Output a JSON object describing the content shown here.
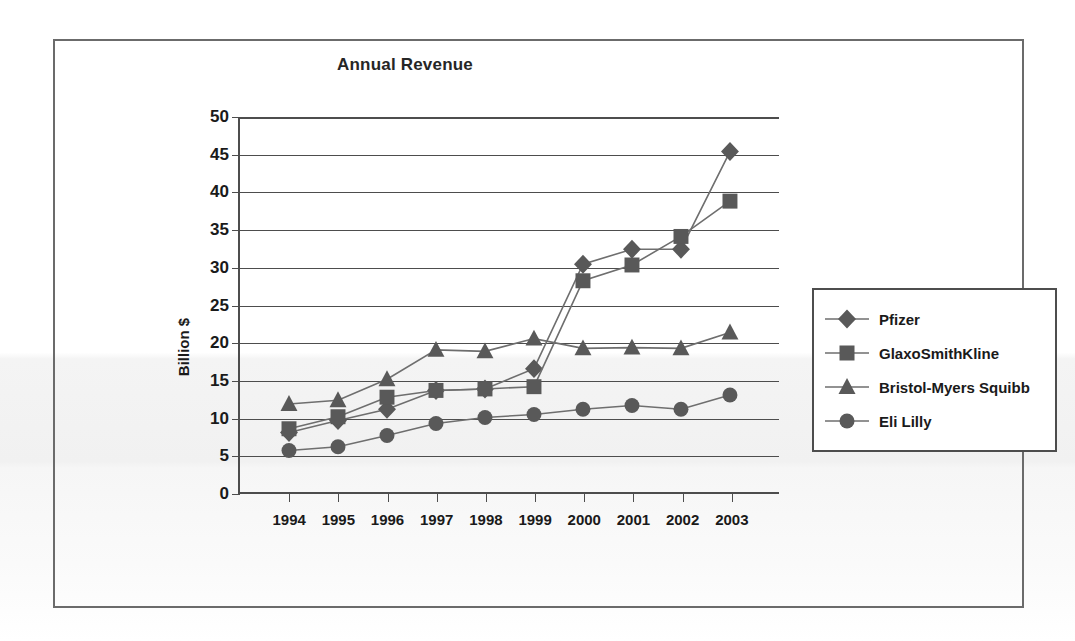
{
  "chart_data": {
    "type": "line",
    "title": "Annual Revenue",
    "xlabel": "",
    "ylabel": "Billion $",
    "ylim": [
      0,
      50
    ],
    "ytick_step": 5,
    "yticks": [
      0,
      5,
      10,
      15,
      20,
      25,
      30,
      35,
      40,
      45,
      50
    ],
    "grid": true,
    "legend_position": "right",
    "categories": [
      "1994",
      "1995",
      "1996",
      "1997",
      "1998",
      "1999",
      "2000",
      "2001",
      "2002",
      "2003"
    ],
    "series": [
      {
        "name": "Pfizer",
        "marker": "diamond",
        "color": "#595959",
        "values": [
          8.0,
          9.6,
          11.1,
          13.6,
          13.8,
          16.5,
          30.4,
          32.4,
          32.4,
          45.4
        ]
      },
      {
        "name": "GlaxoSmithKline",
        "marker": "square",
        "color": "#595959",
        "values": [
          8.5,
          10.1,
          12.7,
          13.6,
          13.8,
          14.1,
          28.2,
          30.3,
          34.1,
          38.8
        ]
      },
      {
        "name": "Bristol-Myers Squibb",
        "marker": "triangle",
        "color": "#595959",
        "values": [
          11.8,
          12.3,
          15.1,
          19.0,
          18.8,
          20.5,
          19.2,
          19.3,
          19.2,
          21.3
        ]
      },
      {
        "name": "Eli Lilly",
        "marker": "circle",
        "color": "#595959",
        "values": [
          5.6,
          6.1,
          7.6,
          9.2,
          10.0,
          10.4,
          11.1,
          11.6,
          11.1,
          13.0
        ]
      }
    ]
  },
  "colors": {
    "frame": "#6b6b6b",
    "axis": "#4d4d4d",
    "marker": "#595959",
    "line": "#6e6e6e",
    "text": "#1a1a1a"
  }
}
